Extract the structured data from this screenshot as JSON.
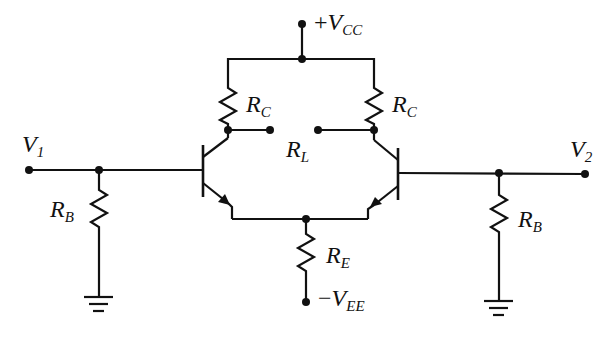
{
  "diagram": {
    "type": "circuit-schematic",
    "colors": {
      "wire": "#111111",
      "background": "#ffffff"
    },
    "labels": {
      "vcc": {
        "sign": "+",
        "main": "V",
        "sub": "CC"
      },
      "vee": {
        "sign": "−",
        "main": "V",
        "sub": "EE"
      },
      "v1": {
        "main": "V",
        "sub": "1"
      },
      "v2": {
        "main": "V",
        "sub": "2"
      },
      "rc_left": {
        "main": "R",
        "sub": "C"
      },
      "rc_right": {
        "main": "R",
        "sub": "C"
      },
      "rl": {
        "main": "R",
        "sub": "L"
      },
      "re": {
        "main": "R",
        "sub": "E"
      },
      "rb_left": {
        "main": "R",
        "sub": "B"
      },
      "rb_right": {
        "main": "R",
        "sub": "B"
      }
    },
    "components": [
      {
        "id": "Q1",
        "kind": "npn-transistor"
      },
      {
        "id": "Q2",
        "kind": "npn-transistor"
      },
      {
        "id": "RC1",
        "kind": "resistor",
        "label": "R_C"
      },
      {
        "id": "RC2",
        "kind": "resistor",
        "label": "R_C"
      },
      {
        "id": "RL",
        "kind": "load-terminals",
        "label": "R_L"
      },
      {
        "id": "RE",
        "kind": "resistor",
        "label": "R_E"
      },
      {
        "id": "RB1",
        "kind": "resistor",
        "label": "R_B"
      },
      {
        "id": "RB2",
        "kind": "resistor",
        "label": "R_B"
      },
      {
        "id": "GND1",
        "kind": "ground"
      },
      {
        "id": "GND2",
        "kind": "ground"
      }
    ]
  }
}
